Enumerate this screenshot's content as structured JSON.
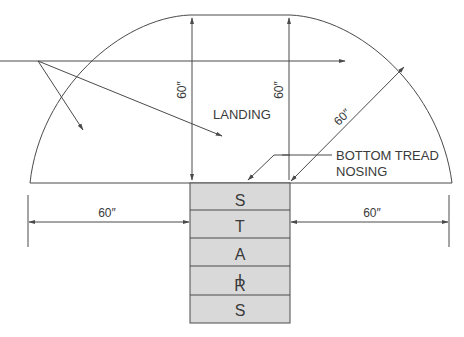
{
  "diagram": {
    "labels": {
      "landing": "LANDING",
      "callout_line1": "BOTTOM TREAD",
      "callout_line2": "NOSING"
    },
    "dimensions": {
      "left_vertical": "60″",
      "right_vertical": "60″",
      "diagonal_radius": "60″",
      "left_horizontal": "60″",
      "right_horizontal": "60″"
    },
    "stairs_letters": [
      "S",
      "T",
      "A",
      "I",
      "R",
      "S"
    ],
    "colors": {
      "line": "#4a4a4a",
      "stair_fill": "#d9d9d9",
      "text": "#3a3a3a"
    }
  }
}
